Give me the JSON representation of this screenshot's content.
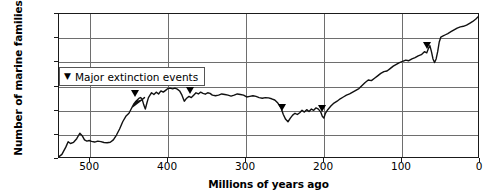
{
  "chart_data": {
    "type": "line",
    "title": "",
    "xlabel": "Millions of years ago",
    "ylabel": "Number of marine families",
    "xlim": [
      540,
      0
    ],
    "ylim": [
      0,
      1200
    ],
    "x_ticks": [
      500,
      400,
      300,
      200,
      100,
      0
    ],
    "x_tick_labels": [
      "500",
      "400",
      "300",
      "200",
      "100",
      "0"
    ],
    "y_ticks": [
      0,
      200,
      400,
      600,
      800,
      1000,
      1200
    ],
    "y_tick_labels": [
      "0",
      "200",
      "400",
      "600",
      "800",
      "1,000",
      "1,200"
    ],
    "grid": true,
    "x_axis_reversed": true,
    "legend": {
      "position": "inside-top-left",
      "marker_glyph": "▼",
      "label": "Major extinction events"
    },
    "series": [
      {
        "name": "Number of marine families",
        "points": [
          [
            540,
            5
          ],
          [
            535,
            30
          ],
          [
            530,
            90
          ],
          [
            527,
            135
          ],
          [
            524,
            120
          ],
          [
            520,
            130
          ],
          [
            516,
            160
          ],
          [
            512,
            205
          ],
          [
            509,
            185
          ],
          [
            506,
            150
          ],
          [
            503,
            140
          ],
          [
            500,
            145
          ],
          [
            497,
            138
          ],
          [
            493,
            132
          ],
          [
            489,
            140
          ],
          [
            485,
            136
          ],
          [
            481,
            128
          ],
          [
            477,
            126
          ],
          [
            473,
            130
          ],
          [
            469,
            150
          ],
          [
            465,
            190
          ],
          [
            461,
            240
          ],
          [
            457,
            300
          ],
          [
            453,
            345
          ],
          [
            449,
            370
          ],
          [
            445,
            420
          ],
          [
            441,
            455
          ],
          [
            437,
            470
          ],
          [
            433,
            478
          ],
          [
            429,
            500
          ],
          [
            445,
            420
          ],
          [
            443,
            445
          ],
          [
            440,
            470
          ],
          [
            436,
            495
          ],
          [
            434,
            500
          ],
          [
            432,
            485
          ],
          [
            430,
            440
          ],
          [
            428,
            405
          ],
          [
            426,
            455
          ],
          [
            424,
            500
          ],
          [
            422,
            520
          ],
          [
            420,
            540
          ],
          [
            417,
            525
          ],
          [
            414,
            545
          ],
          [
            411,
            530
          ],
          [
            408,
            555
          ],
          [
            405,
            545
          ],
          [
            402,
            560
          ],
          [
            399,
            575
          ],
          [
            396,
            578
          ],
          [
            393,
            572
          ],
          [
            390,
            578
          ],
          [
            387,
            570
          ],
          [
            384,
            555
          ],
          [
            381,
            520
          ],
          [
            378,
            470
          ],
          [
            375,
            495
          ],
          [
            372,
            510
          ],
          [
            369,
            500
          ],
          [
            366,
            520
          ],
          [
            363,
            540
          ],
          [
            360,
            530
          ],
          [
            357,
            545
          ],
          [
            354,
            535
          ],
          [
            351,
            528
          ],
          [
            348,
            540
          ],
          [
            345,
            535
          ],
          [
            342,
            520
          ],
          [
            338,
            515
          ],
          [
            334,
            520
          ],
          [
            330,
            530
          ],
          [
            326,
            525
          ],
          [
            322,
            520
          ],
          [
            318,
            512
          ],
          [
            314,
            520
          ],
          [
            310,
            530
          ],
          [
            306,
            525
          ],
          [
            302,
            520
          ],
          [
            298,
            505
          ],
          [
            294,
            510
          ],
          [
            290,
            515
          ],
          [
            286,
            510
          ],
          [
            282,
            500
          ],
          [
            278,
            495
          ],
          [
            274,
            500
          ],
          [
            270,
            498
          ],
          [
            266,
            490
          ],
          [
            262,
            480
          ],
          [
            258,
            455
          ],
          [
            254,
            415
          ],
          [
            251,
            360
          ],
          [
            248,
            320
          ],
          [
            245,
            300
          ],
          [
            242,
            330
          ],
          [
            239,
            355
          ],
          [
            236,
            370
          ],
          [
            233,
            360
          ],
          [
            230,
            375
          ],
          [
            227,
            395
          ],
          [
            224,
            380
          ],
          [
            221,
            400
          ],
          [
            218,
            385
          ],
          [
            215,
            405
          ],
          [
            212,
            395
          ],
          [
            209,
            415
          ],
          [
            206,
            405
          ],
          [
            203,
            380
          ],
          [
            201,
            345
          ],
          [
            199,
            330
          ],
          [
            197,
            370
          ],
          [
            194,
            400
          ],
          [
            190,
            430
          ],
          [
            186,
            455
          ],
          [
            182,
            470
          ],
          [
            178,
            490
          ],
          [
            174,
            505
          ],
          [
            170,
            520
          ],
          [
            166,
            530
          ],
          [
            162,
            545
          ],
          [
            158,
            560
          ],
          [
            154,
            575
          ],
          [
            150,
            600
          ],
          [
            146,
            625
          ],
          [
            142,
            645
          ],
          [
            138,
            640
          ],
          [
            134,
            660
          ],
          [
            130,
            680
          ],
          [
            126,
            700
          ],
          [
            122,
            715
          ],
          [
            118,
            720
          ],
          [
            114,
            740
          ],
          [
            110,
            760
          ],
          [
            106,
            775
          ],
          [
            102,
            790
          ],
          [
            98,
            800
          ],
          [
            94,
            810
          ],
          [
            90,
            805
          ],
          [
            86,
            820
          ],
          [
            82,
            830
          ],
          [
            78,
            845
          ],
          [
            74,
            855
          ],
          [
            70,
            880
          ],
          [
            67,
            870
          ],
          [
            65,
            905
          ],
          [
            63,
            930
          ],
          [
            61,
            880
          ],
          [
            59,
            820
          ],
          [
            57,
            790
          ],
          [
            55,
            820
          ],
          [
            53,
            880
          ],
          [
            51,
            960
          ],
          [
            49,
            1000
          ],
          [
            46,
            1010
          ],
          [
            43,
            1020
          ],
          [
            40,
            1030
          ],
          [
            36,
            1045
          ],
          [
            32,
            1060
          ],
          [
            28,
            1075
          ],
          [
            24,
            1085
          ],
          [
            20,
            1090
          ],
          [
            16,
            1100
          ],
          [
            12,
            1115
          ],
          [
            8,
            1130
          ],
          [
            4,
            1150
          ],
          [
            1,
            1170
          ],
          [
            0,
            1175
          ]
        ]
      }
    ],
    "extinction_events": [
      {
        "x": 440,
        "label": "End-Ordovician"
      },
      {
        "x": 370,
        "label": "Late Devonian"
      },
      {
        "x": 252,
        "label": "End-Permian"
      },
      {
        "x": 201,
        "label": "End-Triassic"
      },
      {
        "x": 66,
        "label": "End-Cretaceous"
      }
    ]
  }
}
